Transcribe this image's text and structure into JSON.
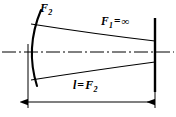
{
  "figure": {
    "background_color": "#ffffff",
    "line_color": "#000000",
    "width": 176,
    "height": 117
  },
  "labels": {
    "curved_mirror_focal": {
      "symbol": "F",
      "subscript": "2"
    },
    "flat_mirror_focal": {
      "symbol": "F",
      "subscript": "1",
      "operator": "=",
      "value": "∞"
    },
    "cavity_length": {
      "symbol": "l",
      "operator": "=",
      "value_symbol": "F",
      "value_subscript": "2"
    }
  },
  "elements": {
    "curved_mirror_name": "concave-mirror",
    "flat_mirror_name": "flat-mirror",
    "optical_axis_name": "optical-axis",
    "beam_envelope_name": "beam-envelope",
    "dimension_name": "cavity-length-dimension"
  },
  "geometry": {
    "curved_mirror_path": "M 41 10 Q 25 48 37 86",
    "beam_upper_path": "M 31 24 Q 95 34 155 41",
    "beam_lower_path": "M 31 80 Q 95 70 155 62",
    "axis_y": 52,
    "axis_x_start": 2,
    "axis_x_end": 174,
    "flat_mirror_x": 155,
    "flat_mirror_y_top": 18,
    "flat_mirror_y_bottom": 92,
    "ext_left_x": 28,
    "ext_right_x": 155,
    "ext_y_top": 44,
    "ext_y_bottom": 108,
    "dim_y": 102,
    "dim_x_start": 28,
    "dim_x_end": 155
  }
}
